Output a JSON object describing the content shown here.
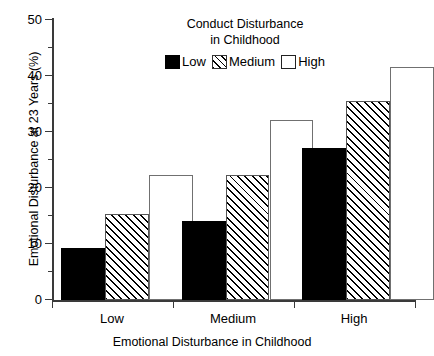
{
  "chart_data": {
    "type": "bar",
    "title": "",
    "categories": [
      "Low",
      "Medium",
      "High"
    ],
    "series": [
      {
        "name": "Low",
        "values": [
          9.2,
          14.1,
          27.1
        ],
        "fill": "solid"
      },
      {
        "name": "Medium",
        "values": [
          15.3,
          22.3,
          35.4
        ],
        "fill": "hatch"
      },
      {
        "name": "High",
        "values": [
          22.3,
          32.1,
          41.5
        ],
        "fill": "open"
      }
    ],
    "xlabel": "Emotional Disturbance in Childhood",
    "ylabel": "Emotional Disturbance at 23 Years (%)",
    "ylim": [
      0,
      50
    ],
    "yticks": [
      0,
      10,
      20,
      30,
      40,
      50
    ],
    "ytick_labels": [
      "0",
      "10",
      "20",
      "30",
      "40",
      "50"
    ],
    "grid": false,
    "legend_position": "top-center"
  },
  "legend": {
    "title_line1": "Conduct Disturbance",
    "title_line2": "in Childhood",
    "entries": [
      {
        "label": "Low"
      },
      {
        "label": "Medium"
      },
      {
        "label": "High"
      }
    ]
  },
  "axes": {
    "y_title": "Emotional Disturbance at 23 Years (%)",
    "x_title": "Emotional Disturbance in Childhood",
    "y_labels": [
      "50",
      "40",
      "30",
      "20",
      "10",
      "0"
    ],
    "x_labels": [
      "Low",
      "Medium",
      "High"
    ]
  }
}
